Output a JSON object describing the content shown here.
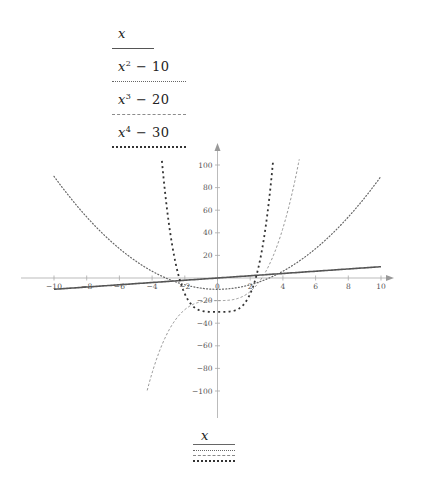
{
  "legend_top": [
    {
      "label_base": "x",
      "label_exp": "",
      "label_rest": "",
      "style": "solid"
    },
    {
      "label_base": "x",
      "label_exp": "2",
      "label_rest": " − 10",
      "style": "dotted"
    },
    {
      "label_base": "x",
      "label_exp": "3",
      "label_rest": " − 20",
      "style": "dashed-fine"
    },
    {
      "label_base": "x",
      "label_exp": "4",
      "label_rest": " − 30",
      "style": "dashed-bold"
    }
  ],
  "legend_bottom": {
    "label": "x"
  },
  "colors": {
    "axis": "#a9a9a9",
    "series_x": "#555555",
    "series_x2": "#666666",
    "series_x3": "#8c8c8c",
    "series_x4": "#333333"
  },
  "chart_data": {
    "type": "line",
    "title": "",
    "xlabel": "",
    "ylabel": "",
    "xlim": [
      -10,
      10
    ],
    "ylim": [
      -100,
      100
    ],
    "grid": false,
    "legend_position": "top-left and bottom-center",
    "x_ticks": [
      -10,
      -8,
      -6,
      -4,
      -2,
      0,
      2,
      4,
      6,
      8,
      10
    ],
    "y_ticks": [
      -100,
      -80,
      -60,
      -40,
      -20,
      20,
      40,
      60,
      80,
      100
    ],
    "x_tick_labels": [
      "−10",
      "−8",
      "−6",
      "−4",
      "−2",
      "0",
      "2",
      "4",
      "6",
      "8",
      "10"
    ],
    "y_tick_labels": [
      "−100",
      "−80",
      "−60",
      "−40",
      "−20",
      "20",
      "40",
      "60",
      "80",
      "100"
    ],
    "series": [
      {
        "name": "x",
        "formula": "x",
        "domain": [
          -10,
          10
        ],
        "line": "solid",
        "points": [
          [
            -10,
            -10
          ],
          [
            -5,
            -5
          ],
          [
            0,
            0
          ],
          [
            5,
            5
          ],
          [
            10,
            10
          ]
        ]
      },
      {
        "name": "x^2 - 10",
        "formula": "x^2-10",
        "domain": [
          -10,
          10
        ],
        "line": "dotted",
        "points": [
          [
            -10,
            90
          ],
          [
            -8,
            54
          ],
          [
            -6,
            26
          ],
          [
            -4,
            6
          ],
          [
            -2,
            -6
          ],
          [
            0,
            -10
          ],
          [
            2,
            -6
          ],
          [
            4,
            6
          ],
          [
            6,
            26
          ],
          [
            8,
            54
          ],
          [
            10,
            90
          ]
        ]
      },
      {
        "name": "x^3 - 20",
        "formula": "x^3-20",
        "domain": [
          -4.3,
          5.0
        ],
        "line": "dashed-fine",
        "points": [
          [
            -4.3,
            -99.5
          ],
          [
            -4,
            -84
          ],
          [
            -3,
            -47
          ],
          [
            -2,
            -28
          ],
          [
            -1,
            -21
          ],
          [
            0,
            -20
          ],
          [
            1,
            -19
          ],
          [
            2,
            -12
          ],
          [
            3,
            7
          ],
          [
            4,
            44
          ],
          [
            5,
            105
          ]
        ]
      },
      {
        "name": "x^4 - 30",
        "formula": "x^4-30",
        "domain": [
          -3.4,
          3.4
        ],
        "line": "dashed-bold",
        "points": [
          [
            -3.4,
            103.6
          ],
          [
            -3,
            51
          ],
          [
            -2,
            -14
          ],
          [
            -1,
            -29
          ],
          [
            0,
            -30
          ],
          [
            1,
            -29
          ],
          [
            2,
            -14
          ],
          [
            3,
            51
          ],
          [
            3.4,
            103.6
          ]
        ]
      }
    ]
  }
}
